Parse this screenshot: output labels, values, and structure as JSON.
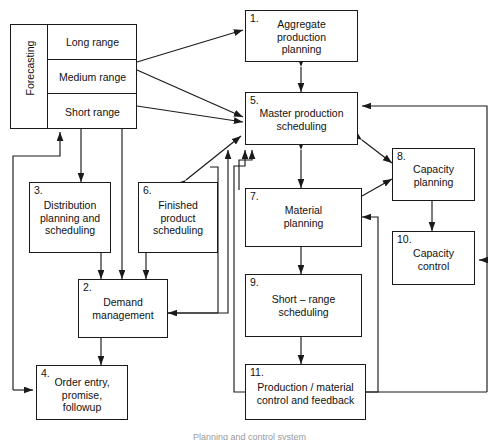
{
  "figure": {
    "type": "block-flow-diagram",
    "caption": "Planning and control system",
    "stroke_color": "#1a1a1a",
    "text_color": "#111111",
    "background": "#ffffff"
  },
  "forecasting": {
    "title": "Forecasting",
    "rows": [
      {
        "label": "Long range"
      },
      {
        "label": "Medium range"
      },
      {
        "label": "Short range"
      }
    ]
  },
  "boxes": [
    {
      "num": "1.",
      "label": "Aggregate\nproduction\nplanning"
    },
    {
      "num": "2.",
      "label": "Demand\nmanagement"
    },
    {
      "num": "3.",
      "label": "Distribution\nplanning and\nscheduling"
    },
    {
      "num": "4.",
      "label": "Order entry,\npromise,\nfollowup"
    },
    {
      "num": "5.",
      "label": "Master production\nscheduling"
    },
    {
      "num": "6.",
      "label": "Finished\nproduct\nscheduling"
    },
    {
      "num": "7.",
      "label": "Material\nplanning"
    },
    {
      "num": "8.",
      "label": "Capacity\nplanning"
    },
    {
      "num": "9.",
      "label": "Short – range\nscheduling"
    },
    {
      "num": "10.",
      "label": "Capacity\ncontrol"
    },
    {
      "num": "11.",
      "label": "Production / material\ncontrol and feedback"
    }
  ]
}
